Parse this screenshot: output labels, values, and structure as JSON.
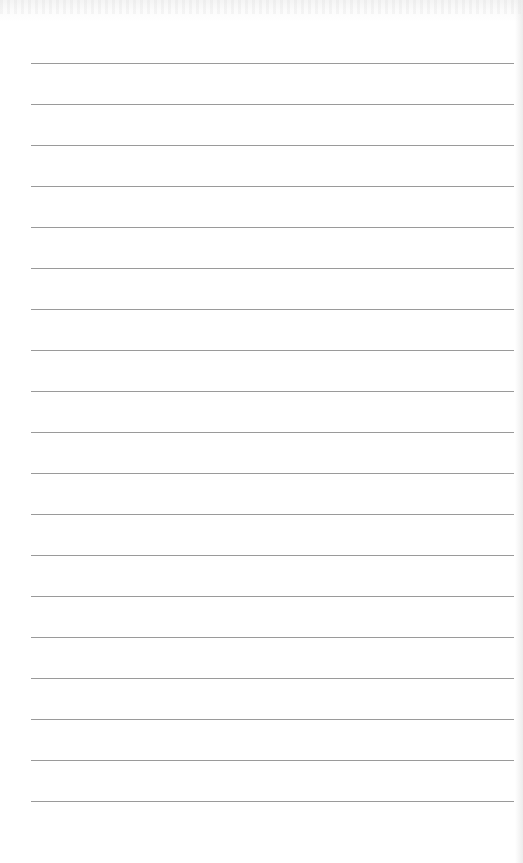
{
  "sheet": {
    "type": "lined-paper",
    "background_color": "#ffffff",
    "line_color": "#9a9a9a",
    "line_count": 19,
    "first_line_y": 63,
    "line_spacing": 41,
    "line_left": 31,
    "line_right": 514,
    "text": ""
  }
}
